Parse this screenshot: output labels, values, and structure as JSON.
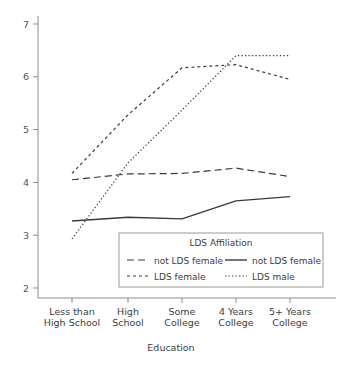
{
  "chart_data": {
    "type": "line",
    "title": "",
    "xlabel": "Education",
    "ylabel": "",
    "categories": [
      "Less than High School",
      "High School",
      "Some College",
      "4 Years College",
      "5+ Years College"
    ],
    "category_lines": [
      [
        "Less than",
        "High School"
      ],
      [
        "High",
        "School"
      ],
      [
        "Some",
        "College"
      ],
      [
        "4 Years",
        "College"
      ],
      [
        "5+ Years",
        "College"
      ]
    ],
    "ylim": [
      2,
      7
    ],
    "yticks": [
      2,
      3,
      4,
      5,
      6,
      7
    ],
    "ytick_labels": [
      "2",
      "3",
      "4",
      "5",
      "6",
      "7"
    ],
    "grid": false,
    "legend_position": "inside-bottom-center",
    "legend_title": "LDS Affiliation",
    "series": [
      {
        "name": "not LDS female",
        "dash": "longdash",
        "dasharray": "7,4",
        "width": 1.2,
        "color": "#3a3a3a",
        "values": [
          4.05,
          4.16,
          4.17,
          4.27,
          4.11
        ]
      },
      {
        "name": "LDS female",
        "dash": "shortdash",
        "dasharray": "3,3",
        "width": 1.2,
        "color": "#3a3a3a",
        "values": [
          4.17,
          5.28,
          6.17,
          6.23,
          5.95
        ]
      },
      {
        "name": "not LDS female",
        "dash": "solid",
        "dasharray": "",
        "width": 1.4,
        "color": "#3a3a3a",
        "values": [
          3.27,
          3.34,
          3.31,
          3.65,
          3.73
        ]
      },
      {
        "name": "LDS male",
        "dash": "dotted",
        "dasharray": "1.3,2.2",
        "width": 1.2,
        "color": "#3a3a3a",
        "values": [
          2.93,
          4.37,
          5.37,
          6.4,
          6.4
        ]
      }
    ]
  },
  "legend": {
    "title": "LDS Affiliation",
    "entries": [
      {
        "label": "not LDS female",
        "dasharray": "7,4",
        "width": 1.2
      },
      {
        "label": "not LDS female",
        "dasharray": "",
        "width": 1.4
      },
      {
        "label": "LDS female",
        "dasharray": "3,3",
        "width": 1.2
      },
      {
        "label": "LDS male",
        "dasharray": "1.3,2.2",
        "width": 1.2
      }
    ]
  },
  "colors": {
    "line": "#3a3a3a",
    "axis": "#8d8d8d",
    "text": "#3d3d3d",
    "background": "#ffffff"
  }
}
